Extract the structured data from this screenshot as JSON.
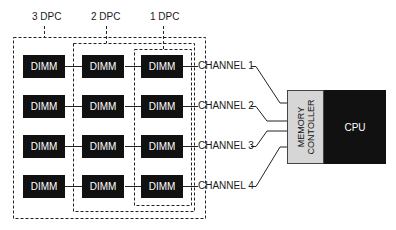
{
  "diagram": {
    "groups": [
      {
        "label": "3 DPC"
      },
      {
        "label": "2 DPC"
      },
      {
        "label": "1 DPC"
      }
    ],
    "dimm_label": "DIMM",
    "rows": [
      {
        "dimms": [
          "DIMM",
          "DIMM",
          "DIMM"
        ],
        "channel": "CHANNEL 1"
      },
      {
        "dimms": [
          "DIMM",
          "DIMM",
          "DIMM"
        ],
        "channel": "CHANNEL 2"
      },
      {
        "dimms": [
          "DIMM",
          "DIMM",
          "DIMM"
        ],
        "channel": "CHANNEL 3"
      },
      {
        "dimms": [
          "DIMM",
          "DIMM",
          "DIMM"
        ],
        "channel": "CHANNEL 4"
      }
    ],
    "memory_controller": {
      "line1": "MEMORY",
      "line2": "CONTOLLER"
    },
    "cpu": "CPU",
    "colors": {
      "dimm": "#111111",
      "cpu": "#111111",
      "controller": "#d6d6d6",
      "line": "#222222"
    }
  }
}
